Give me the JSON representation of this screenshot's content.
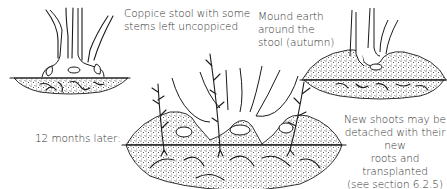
{
  "diagram": {
    "labels": {
      "stool": "Coppice stool with some stems left uncoppiced",
      "stool_lines": [
        "Coppice stool with some",
        "stems left uncoppiced"
      ],
      "mound_lines": [
        "Mound earth",
        "around the",
        "stool (autumn)"
      ],
      "later": "12 months later:",
      "shoots_lines": [
        "New shoots may be",
        "detached with their new",
        "roots and transplanted",
        "(see section 6.2.5)"
      ]
    },
    "panels": [
      {
        "id": "coppice-stool",
        "caption": "Coppice stool with some stems left uncoppiced"
      },
      {
        "id": "mounded-stool",
        "caption": "Mound earth around the stool (autumn)"
      },
      {
        "id": "twelve-months-later",
        "caption": "12 months later:"
      }
    ],
    "colors": {
      "ink": "#1a1a1a",
      "text": "#333333",
      "background": "#ffffff"
    }
  }
}
